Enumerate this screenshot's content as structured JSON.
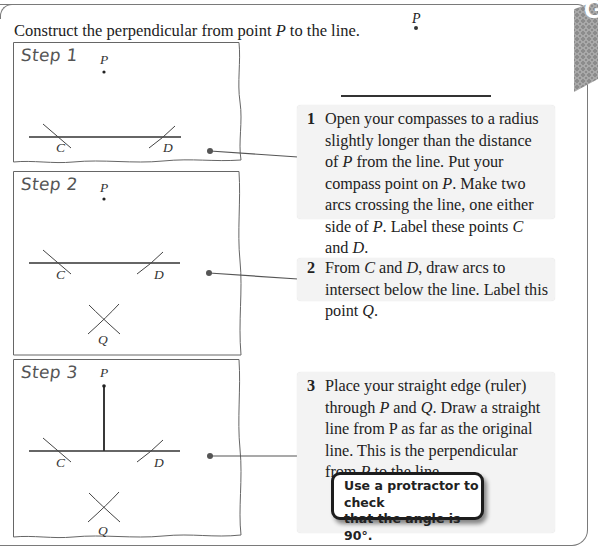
{
  "header": {
    "instruction_prefix": "Construct the perpendicular from point ",
    "instruction_point": "P",
    "instruction_suffix": " to the line.",
    "example_point_label": "P"
  },
  "steps": [
    {
      "label": "Step 1",
      "diagram_labels": {
        "p": "P",
        "c": "C",
        "d": "D"
      },
      "number": "1",
      "text_parts": [
        "Open your compasses to a radius slightly longer than the distance of ",
        "P",
        " from the line. Put your compass point on ",
        "P",
        ". Make two arcs crossing the line, one either side of ",
        "P",
        ". Label these points ",
        "C",
        " and ",
        "D",
        "."
      ]
    },
    {
      "label": "Step 2",
      "diagram_labels": {
        "p": "P",
        "c": "C",
        "d": "D",
        "q": "Q"
      },
      "number": "2",
      "text_parts": [
        "From ",
        "C",
        " and ",
        "D",
        ", draw arcs to intersect below the line. Label this point ",
        "Q",
        "."
      ]
    },
    {
      "label": "Step 3",
      "diagram_labels": {
        "p": "P",
        "c": "C",
        "d": "D",
        "q": "Q"
      },
      "number": "3",
      "text_parts": [
        "Place your straight edge (ruler) through ",
        "P",
        " and ",
        "Q",
        ". Draw a straight line from P as far as the original line. This is the perpendicular from ",
        "P",
        " to the line."
      ]
    }
  ],
  "callout": {
    "line1": "Use a protractor to check",
    "line2": "that the angle is 90°."
  },
  "tab_letter": "G",
  "colors": {
    "box_background": "#f3f3f3",
    "frame_stroke": "#666666",
    "callout_border": "#1d1d1d",
    "tab_pattern": "#9a9a9a"
  }
}
